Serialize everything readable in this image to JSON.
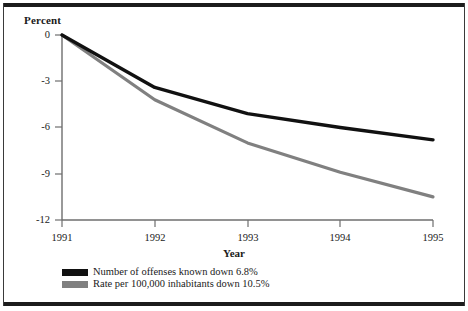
{
  "chart_data": {
    "type": "line",
    "title": "",
    "xlabel": "Year",
    "ylabel": "Percent",
    "categories": [
      "1991",
      "1992",
      "1993",
      "1994",
      "1995"
    ],
    "x": [
      1991,
      1992,
      1993,
      1994,
      1995
    ],
    "xlim": [
      1991,
      1995
    ],
    "ylim": [
      -12,
      0
    ],
    "yticks": [
      0,
      -3,
      -6,
      -9,
      -12
    ],
    "ytick_labels": [
      "0",
      "-3",
      "-6",
      "-9",
      "-12"
    ],
    "grid": false,
    "legend_position": "bottom-left",
    "series": [
      {
        "name": "Number of offenses known down 6.8%",
        "color": "#111111",
        "values": [
          0,
          -3.4,
          -5.1,
          -6.0,
          -6.8
        ]
      },
      {
        "name": "Rate per 100,000 inhabitants down 10.5%",
        "color": "#808080",
        "values": [
          0,
          -4.2,
          -7.0,
          -8.9,
          -10.5
        ]
      }
    ]
  },
  "axes": {
    "y_title": "Percent",
    "x_title": "Year",
    "y_tick_labels": [
      "0",
      "-3",
      "-6",
      "-9",
      "-12"
    ],
    "x_tick_labels": [
      "1991",
      "1992",
      "1993",
      "1994",
      "1995"
    ]
  },
  "legend": {
    "items": [
      {
        "label": "Number of offenses known down 6.8%",
        "color": "#111111"
      },
      {
        "label": "Rate per 100,000 inhabitants down 10.5%",
        "color": "#808080"
      }
    ]
  },
  "colors": {
    "series_black": "#111111",
    "series_gray": "#808080",
    "axis": "#6e6e6e",
    "frame": "#1c1c1c"
  }
}
